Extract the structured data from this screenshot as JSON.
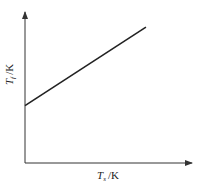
{
  "chart_data": {
    "type": "line",
    "title": "",
    "xlabel": "T_s /K",
    "ylabel": "T_f /K",
    "xlabel_parts": {
      "symbol": "T",
      "subscript": "s",
      "unit": "/K"
    },
    "ylabel_parts": {
      "symbol": "T",
      "subscript": "f",
      "unit": "/K"
    },
    "grid": false,
    "legend": null,
    "ticks": false,
    "series": [
      {
        "name": "T_f vs T_s",
        "description": "linear increasing relation with positive intercept",
        "x": [
          0,
          1
        ],
        "y": [
          0.38,
          0.9
        ]
      }
    ],
    "xlim": [
      0,
      1
    ],
    "ylim": [
      0,
      1
    ],
    "colors": {
      "line": "#222222",
      "axis": "#333333"
    }
  }
}
